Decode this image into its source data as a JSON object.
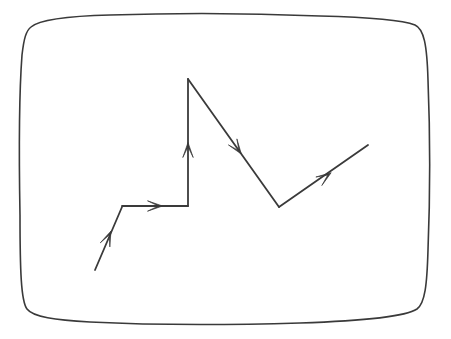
{
  "figure": {
    "width": 451,
    "height": 339,
    "background_color": "#ffffff",
    "stroke_color": "#3a3a3a",
    "frame_stroke_width": 1.6,
    "path_stroke_width": 1.8
  },
  "frame": {
    "name": "hand-drawn rounded rectangle border",
    "shape": "rounded-rectangle",
    "style": "sketchy",
    "corner_radius": 22,
    "bounds": {
      "left": 21,
      "top": 20,
      "right": 428,
      "bottom": 323
    },
    "outline_path": "M 31 27 C 40 19 70 16 110 15 C 170 13 250 13 320 16 C 360 17 400 19 415 25 C 424 29 427 45 428 80 C 430 130 430 200 428 250 C 427 285 425 303 417 309 C 405 317 360 321 300 323 C 230 325 150 325 90 322 C 55 320 33 317 27 309 C 21 301 20 270 20 215 C 19 160 19 95 22 55 C 24 38 26 31 31 27 Z"
  },
  "path_drawing": {
    "name": "directed polyline",
    "type": "polyline-with-arrowheads",
    "segment_count": 5,
    "arrowhead_count": 5,
    "vertices": [
      {
        "label": "start",
        "x": 95,
        "y": 270
      },
      {
        "label": "v1",
        "x": 122,
        "y": 207
      },
      {
        "label": "v2",
        "x": 188,
        "y": 206
      },
      {
        "label": "v3-peak",
        "x": 188,
        "y": 79
      },
      {
        "label": "v4-valley",
        "x": 279,
        "y": 207
      },
      {
        "label": "end",
        "x": 368,
        "y": 145
      }
    ],
    "segments": [
      {
        "name": "segment-1-diagonal-up-right",
        "from": [
          95,
          270
        ],
        "to": [
          122,
          207
        ],
        "direction": "up-right",
        "arrow_at": [
          108,
          238
        ]
      },
      {
        "name": "segment-2-horizontal-right",
        "from": [
          122,
          206
        ],
        "to": [
          188,
          206
        ],
        "direction": "right",
        "arrow_at": [
          155,
          206
        ]
      },
      {
        "name": "segment-3-vertical-up",
        "from": [
          188,
          206
        ],
        "to": [
          188,
          79
        ],
        "direction": "up",
        "arrow_at": [
          188,
          150
        ]
      },
      {
        "name": "segment-4-diagonal-down-right",
        "from": [
          188,
          79
        ],
        "to": [
          279,
          207
        ],
        "direction": "down-right",
        "arrow_at": [
          237,
          148
        ]
      },
      {
        "name": "segment-5-diagonal-up-right",
        "from": [
          279,
          207
        ],
        "to": [
          368,
          145
        ],
        "direction": "up-right",
        "arrow_at": [
          325,
          177
        ]
      }
    ]
  }
}
